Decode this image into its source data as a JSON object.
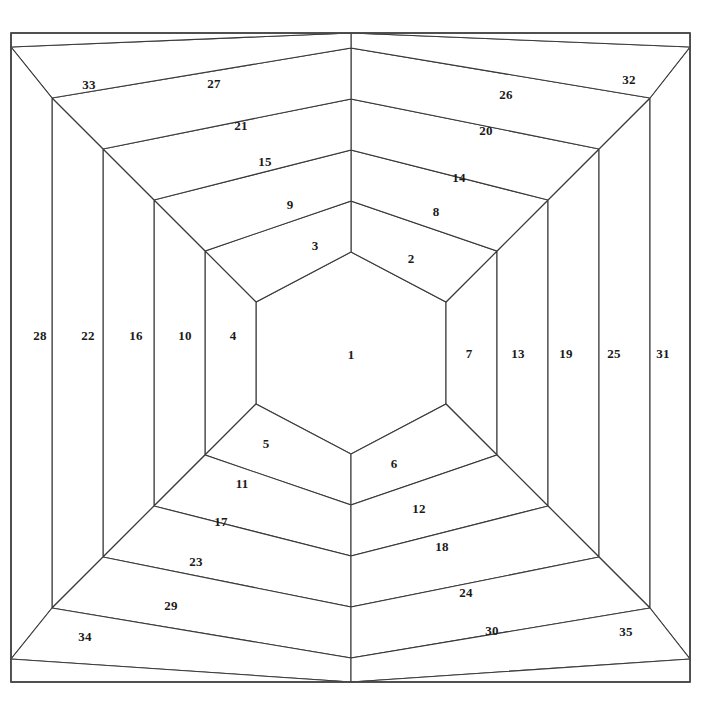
{
  "figure": {
    "type": "diagram",
    "kind": "hexagonal-log-cabin-quilt-block-piecing-order",
    "background_color": "#ffffff",
    "line_color": "#3a3a3a",
    "label_color": "#1a1a1a",
    "frame": {
      "x": 11,
      "y": 33,
      "width": 679,
      "height": 649
    },
    "center_hexagon": {
      "cx": 351,
      "cy": 353,
      "half_width": 95,
      "half_height": 101,
      "flat_half_height": 51
    },
    "ring_step": 51,
    "rings": 6,
    "total_pieces": 35
  },
  "pieces": [
    {
      "id": 1,
      "label": "1",
      "x": 351,
      "y": 355,
      "ring": 0,
      "side": "center"
    },
    {
      "id": 2,
      "label": "2",
      "x": 411,
      "y": 259,
      "ring": 1,
      "side": "upper-right"
    },
    {
      "id": 3,
      "label": "3",
      "x": 315,
      "y": 246,
      "ring": 1,
      "side": "upper-left"
    },
    {
      "id": 4,
      "label": "4",
      "x": 233,
      "y": 336,
      "ring": 1,
      "side": "left"
    },
    {
      "id": 5,
      "label": "5",
      "x": 266,
      "y": 444,
      "ring": 1,
      "side": "lower-left"
    },
    {
      "id": 6,
      "label": "6",
      "x": 394,
      "y": 464,
      "ring": 1,
      "side": "lower-right"
    },
    {
      "id": 7,
      "label": "7",
      "x": 469,
      "y": 354,
      "ring": 1,
      "side": "right"
    },
    {
      "id": 8,
      "label": "8",
      "x": 436,
      "y": 212,
      "ring": 2,
      "side": "upper-right"
    },
    {
      "id": 9,
      "label": "9",
      "x": 290,
      "y": 205,
      "ring": 2,
      "side": "upper-left"
    },
    {
      "id": 10,
      "label": "10",
      "x": 185,
      "y": 336,
      "ring": 2,
      "side": "left"
    },
    {
      "id": 11,
      "label": "11",
      "x": 242,
      "y": 484,
      "ring": 2,
      "side": "lower-left"
    },
    {
      "id": 12,
      "label": "12",
      "x": 419,
      "y": 509,
      "ring": 2,
      "side": "lower-right"
    },
    {
      "id": 13,
      "label": "13",
      "x": 518,
      "y": 354,
      "ring": 2,
      "side": "right"
    },
    {
      "id": 14,
      "label": "14",
      "x": 459,
      "y": 178,
      "ring": 3,
      "side": "upper-right"
    },
    {
      "id": 15,
      "label": "15",
      "x": 265,
      "y": 162,
      "ring": 3,
      "side": "upper-left"
    },
    {
      "id": 16,
      "label": "16",
      "x": 136,
      "y": 336,
      "ring": 3,
      "side": "left"
    },
    {
      "id": 17,
      "label": "17",
      "x": 221,
      "y": 522,
      "ring": 3,
      "side": "lower-left"
    },
    {
      "id": 18,
      "label": "18",
      "x": 442,
      "y": 547,
      "ring": 3,
      "side": "lower-right"
    },
    {
      "id": 19,
      "label": "19",
      "x": 566,
      "y": 354,
      "ring": 3,
      "side": "right"
    },
    {
      "id": 20,
      "label": "20",
      "x": 486,
      "y": 131,
      "ring": 4,
      "side": "upper-right"
    },
    {
      "id": 21,
      "label": "21",
      "x": 241,
      "y": 126,
      "ring": 4,
      "side": "upper-left"
    },
    {
      "id": 22,
      "label": "22",
      "x": 88,
      "y": 336,
      "ring": 4,
      "side": "left"
    },
    {
      "id": 23,
      "label": "23",
      "x": 196,
      "y": 562,
      "ring": 4,
      "side": "lower-left"
    },
    {
      "id": 24,
      "label": "24",
      "x": 466,
      "y": 593,
      "ring": 4,
      "side": "lower-right"
    },
    {
      "id": 25,
      "label": "25",
      "x": 614,
      "y": 354,
      "ring": 4,
      "side": "right"
    },
    {
      "id": 26,
      "label": "26",
      "x": 506,
      "y": 95,
      "ring": 5,
      "side": "upper-right"
    },
    {
      "id": 27,
      "label": "27",
      "x": 214,
      "y": 84,
      "ring": 5,
      "side": "upper-left"
    },
    {
      "id": 28,
      "label": "28",
      "x": 40,
      "y": 336,
      "ring": 5,
      "side": "left"
    },
    {
      "id": 29,
      "label": "29",
      "x": 171,
      "y": 606,
      "ring": 5,
      "side": "lower-left"
    },
    {
      "id": 30,
      "label": "30",
      "x": 492,
      "y": 631,
      "ring": 5,
      "side": "lower-right"
    },
    {
      "id": 31,
      "label": "31",
      "x": 663,
      "y": 354,
      "ring": 5,
      "side": "right"
    },
    {
      "id": 32,
      "label": "32",
      "x": 629,
      "y": 80,
      "ring": 6,
      "side": "corner-top-right"
    },
    {
      "id": 33,
      "label": "33",
      "x": 89,
      "y": 85,
      "ring": 6,
      "side": "corner-top-left"
    },
    {
      "id": 34,
      "label": "34",
      "x": 85,
      "y": 637,
      "ring": 6,
      "side": "corner-bottom-left"
    },
    {
      "id": 35,
      "label": "35",
      "x": 626,
      "y": 632,
      "ring": 6,
      "side": "corner-bottom-right"
    }
  ]
}
